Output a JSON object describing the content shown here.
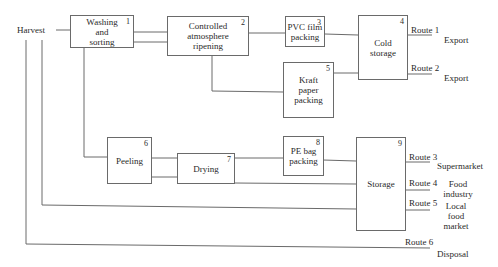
{
  "diagram": {
    "source": "Harvest",
    "processes": [
      {
        "id": "1",
        "label": "Washing\nand\nsorting"
      },
      {
        "id": "2",
        "label": "Controlled\natmosphere\nripening"
      },
      {
        "id": "3",
        "label": "PVC film\npacking"
      },
      {
        "id": "4",
        "label": "Cold\nstorage"
      },
      {
        "id": "5",
        "label": "Kraft\npaper\npacking"
      },
      {
        "id": "6",
        "label": "Peeling"
      },
      {
        "id": "7",
        "label": "Drying"
      },
      {
        "id": "8",
        "label": "PE bag\npacking"
      },
      {
        "id": "9",
        "label": "Storage"
      }
    ],
    "routes": [
      {
        "label": "Route 1",
        "destination": "Export"
      },
      {
        "label": "Route 2",
        "destination": "Export"
      },
      {
        "label": "Route 3",
        "destination": "Supermarket"
      },
      {
        "label": "Route 4",
        "destination": "Food\nindustry"
      },
      {
        "label": "Route 5",
        "destination": "Local\nfood\nmarket"
      },
      {
        "label": "Route 6",
        "destination": "Disposal"
      }
    ],
    "colors": {
      "line": "#6a6a6a",
      "text": "#2a2a2a",
      "background": "#ffffff"
    }
  }
}
